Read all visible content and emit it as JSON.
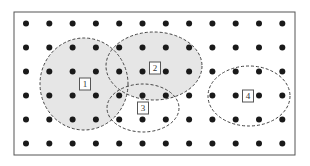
{
  "diagram": {
    "frame": {
      "x": 14,
      "y": 12,
      "width": 281,
      "height": 143,
      "stroke": "#555555"
    },
    "grid": {
      "columns": 12,
      "rows": 6,
      "x0": 26,
      "y0": 23.5,
      "dx": 23.3,
      "dy": 24,
      "dot_radius": 3,
      "dot_color": "#1a1a1a"
    },
    "regions": [
      {
        "id": "1",
        "label": "1",
        "cx": 84,
        "cy": 84,
        "rx": 44,
        "ry": 46,
        "fill": "#e6e6e6",
        "stroke": "#444444"
      },
      {
        "id": "2",
        "label": "2",
        "cx": 154,
        "cy": 66,
        "rx": 48,
        "ry": 34,
        "fill": "#e6e6e6",
        "stroke": "#444444"
      },
      {
        "id": "3",
        "label": "3",
        "cx": 143,
        "cy": 108,
        "rx": 36,
        "ry": 24,
        "fill": "none",
        "stroke": "#444444"
      },
      {
        "id": "4",
        "label": "4",
        "cx": 249,
        "cy": 96,
        "rx": 41,
        "ry": 30,
        "fill": "none",
        "stroke": "#444444"
      }
    ],
    "labels": [
      {
        "text": "1",
        "x": 85,
        "y": 84
      },
      {
        "text": "2",
        "x": 155,
        "y": 68
      },
      {
        "text": "3",
        "x": 143,
        "y": 108
      },
      {
        "text": "4",
        "x": 248,
        "y": 96
      }
    ]
  }
}
